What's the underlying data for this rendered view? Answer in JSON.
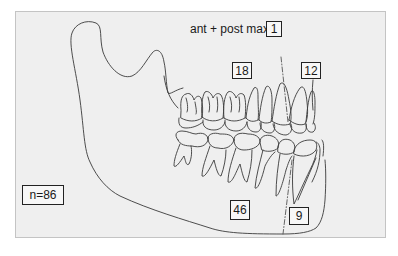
{
  "diagram": {
    "type": "dental-jaw-illustration",
    "title": "ant + post max",
    "labels": {
      "ant_post_max": "ant + post max",
      "box_top": "1",
      "upper_molar_region": "18",
      "upper_anterior_region": "12",
      "sample_size": "n=86",
      "lower_molar_region": "46",
      "lower_anterior_region": "9"
    },
    "colors": {
      "panel_background": "#efefef",
      "panel_border": "#c4c4c4",
      "line": "#333333",
      "box_border": "#222222"
    }
  }
}
